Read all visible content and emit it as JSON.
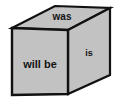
{
  "figure": {
    "name": "tense-cube-diagram",
    "background_color": "#ffffff",
    "fill_color": "#c2c2c2",
    "stroke_color": "#111111",
    "text_color": "#141414"
  },
  "faces": {
    "top": {
      "label": "was",
      "icon_name": "cube-top-face",
      "points": "12,28 55,6 110,8 68,30",
      "text_x": 62,
      "text_y": 17
    },
    "front": {
      "label": "will be",
      "icon_name": "cube-front-face",
      "points": "12,28 68,30 68,94 12,95",
      "text_x": 40,
      "text_y": 65
    },
    "right": {
      "label": "is",
      "icon_name": "cube-right-face",
      "points": "68,30 110,8 110,75 68,94",
      "text_x": 89,
      "text_y": 54
    }
  }
}
